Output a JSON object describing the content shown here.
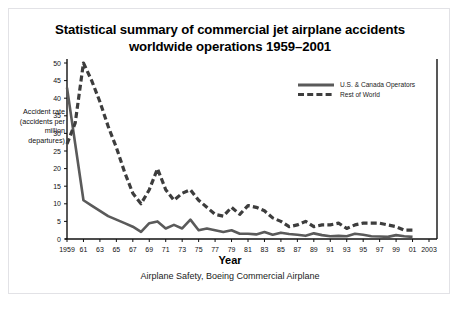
{
  "figure": {
    "title_line1": "Statistical summary of commercial jet airplane accidents",
    "title_line2": "worldwide operations 1959–2001",
    "caption": "Airplane Safety, Boeing Commercial Airplane",
    "border_color": "#e2e2e6",
    "background": "#ffffff"
  },
  "chart_data": {
    "type": "line",
    "title": "Statistical summary of commercial jet airplane accidents worldwide operations 1959–2001",
    "xlabel": "Year",
    "ylabel": "Accident rate (accidents per million departures)",
    "ylim": [
      0,
      50
    ],
    "xlim": [
      1959,
      2003
    ],
    "yticks": [
      0,
      5,
      10,
      15,
      20,
      25,
      30,
      35,
      40,
      45,
      50
    ],
    "xticks": [
      1959,
      1961,
      1963,
      1965,
      1967,
      1969,
      1971,
      1973,
      1975,
      1977,
      1979,
      1981,
      1983,
      1985,
      1987,
      1989,
      1991,
      1993,
      1995,
      1997,
      1999,
      2001,
      2003
    ],
    "xtick_labels": [
      "1959",
      "61",
      "63",
      "65",
      "67",
      "69",
      "71",
      "73",
      "75",
      "77",
      "79",
      "81",
      "83",
      "85",
      "87",
      "89",
      "91",
      "93",
      "95",
      "97",
      "99",
      "01",
      "2003"
    ],
    "grid": false,
    "legend_position": "top-right",
    "x": [
      1959,
      1960,
      1961,
      1962,
      1963,
      1964,
      1965,
      1966,
      1967,
      1968,
      1969,
      1970,
      1971,
      1972,
      1973,
      1974,
      1975,
      1976,
      1977,
      1978,
      1979,
      1980,
      1981,
      1982,
      1983,
      1984,
      1985,
      1986,
      1987,
      1988,
      1989,
      1990,
      1991,
      1992,
      1993,
      1994,
      1995,
      1996,
      1997,
      1998,
      1999,
      2000,
      2001
    ],
    "series": [
      {
        "name": "U.S. & Canada Operators",
        "style": "solid",
        "color": "#5a5a5a",
        "values": [
          43,
          27,
          11,
          9.5,
          8,
          6.5,
          5.5,
          4.5,
          3.5,
          2,
          4.5,
          5,
          3,
          4,
          3,
          5.5,
          2.5,
          3,
          2.5,
          2,
          2.5,
          1.5,
          1.5,
          1.3,
          2,
          1.2,
          1.8,
          1.4,
          1.2,
          0.9,
          1.6,
          1.1,
          0.8,
          0.9,
          0.8,
          1.5,
          1.2,
          0.8,
          0.7,
          0.6,
          1.1,
          0.8,
          0.6
        ]
      },
      {
        "name": "Rest of World",
        "style": "dashed",
        "color": "#3d3d3d",
        "values": [
          27,
          33,
          50,
          45,
          39,
          32,
          26,
          19,
          13,
          10,
          14,
          20,
          14,
          11,
          13,
          14,
          11,
          9,
          7,
          6.5,
          9,
          7,
          9.5,
          9,
          8,
          6,
          5,
          3.5,
          4,
          5,
          3.5,
          4,
          4,
          4.5,
          3,
          4,
          4.5,
          4.5,
          4.5,
          4,
          3.5,
          2.5,
          2.5
        ]
      }
    ]
  },
  "axis": {
    "ylabel_text": "Accident rate (accidents per million departures)",
    "xlabel_text": "Year"
  },
  "legend": {
    "items": [
      {
        "label": "U.S. & Canada Operators",
        "style": "solid"
      },
      {
        "label": "Rest of World",
        "style": "dashed"
      }
    ]
  }
}
